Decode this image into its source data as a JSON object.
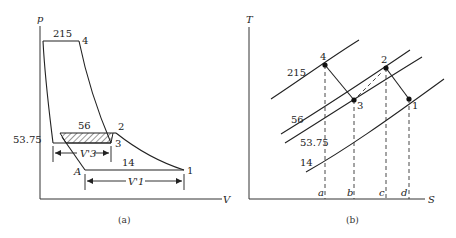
{
  "figure": {
    "panel_a": {
      "caption": "(a)",
      "y_axis_label": "p",
      "x_axis_label": "V",
      "pressure_labels": {
        "p215": "215",
        "p56": "56",
        "p53_75": "53.75",
        "p14": "14"
      },
      "state_points": {
        "s1": "1",
        "s2": "2",
        "s3": "3",
        "s4": "4",
        "sA": "A"
      },
      "dimension_labels": {
        "v3": "V'3",
        "v1": "V'1"
      }
    },
    "panel_b": {
      "caption": "(b)",
      "y_axis_label": "T",
      "x_axis_label": "S",
      "isobar_labels": {
        "p215": "215",
        "p56": "56",
        "p53_75": "53.75",
        "p14": "14"
      },
      "state_points": {
        "s1": "1",
        "s2": "2",
        "s3": "3",
        "s4": "4"
      },
      "entropy_ticks": {
        "a": "a",
        "b": "b",
        "c": "c",
        "d": "d"
      }
    }
  }
}
